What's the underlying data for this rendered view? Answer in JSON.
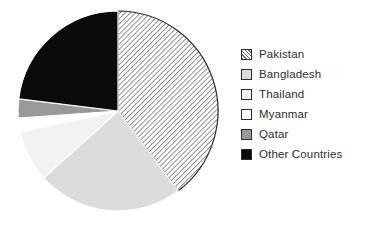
{
  "chart_data": {
    "type": "pie",
    "title": "",
    "subtitle": "",
    "xlabel": "",
    "ylabel": "",
    "grid": false,
    "legend_position": "right",
    "start_angle_deg": 0,
    "direction": "clockwise",
    "categories": [
      "Pakistan",
      "Bangladesh",
      "Thailand",
      "Myanmar",
      "Qatar",
      "Other Countries"
    ],
    "values": [
      39.7,
      23.6,
      8.3,
      2.2,
      3.1,
      23.1
    ],
    "units": "percent",
    "slices": [
      {
        "label": "Pakistan",
        "value": 39.7,
        "start_angle_deg": 0,
        "end_angle_deg": 143,
        "fill_style": "diagonal-hatch",
        "color": "#ffffff",
        "hatch_color": "#6d6d6d",
        "edge_color": "#2b2b2b"
      },
      {
        "label": "Bangladesh",
        "value": 23.6,
        "start_angle_deg": 143,
        "end_angle_deg": 228,
        "fill_style": "solid",
        "color": "#dcdcdc",
        "edge_color": "#ffffff"
      },
      {
        "label": "Thailand",
        "value": 8.3,
        "start_angle_deg": 228,
        "end_angle_deg": 258,
        "fill_style": "solid",
        "color": "#f2f2f2",
        "edge_color": "#ffffff"
      },
      {
        "label": "Myanmar",
        "value": 2.2,
        "start_angle_deg": 258,
        "end_angle_deg": 266,
        "fill_style": "solid",
        "color": "#ffffff",
        "edge_color": "#ffffff"
      },
      {
        "label": "Qatar",
        "value": 3.1,
        "start_angle_deg": 266,
        "end_angle_deg": 277,
        "fill_style": "solid",
        "color": "#999999",
        "edge_color": "#ffffff"
      },
      {
        "label": "Other Countries",
        "value": 23.1,
        "start_angle_deg": 277,
        "end_angle_deg": 360,
        "fill_style": "solid",
        "color": "#0b0b0b",
        "edge_color": "#ffffff"
      }
    ]
  },
  "legend": {
    "items": [
      {
        "label": "Pakistan",
        "swatch": "hatch-swatch"
      },
      {
        "label": "Bangladesh",
        "swatch": "light-gray-swatch"
      },
      {
        "label": "Thailand",
        "swatch": "pale-gray-swatch"
      },
      {
        "label": "Myanmar",
        "swatch": "white-swatch"
      },
      {
        "label": "Qatar",
        "swatch": "mid-gray-swatch"
      },
      {
        "label": "Other Countries",
        "swatch": "black-swatch"
      }
    ]
  }
}
